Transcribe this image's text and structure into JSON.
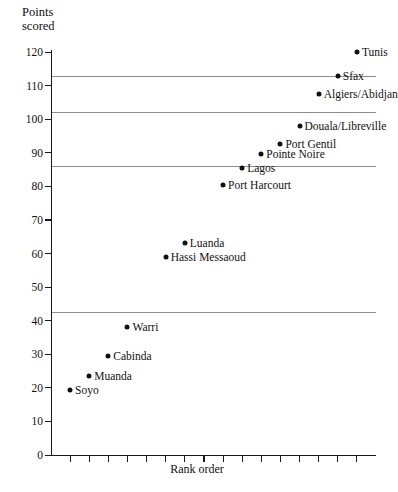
{
  "chart_data": {
    "type": "scatter",
    "title": "",
    "ylabel": "Points\nscored",
    "xlabel": "Rank order",
    "ylim": [
      0,
      120
    ],
    "ytick_values": [
      0,
      10,
      20,
      30,
      40,
      50,
      60,
      70,
      80,
      90,
      100,
      110,
      120
    ],
    "ytick_labels": [
      "0",
      "10",
      "20",
      "30",
      "40",
      "50",
      "60",
      "70",
      "80",
      "90",
      "100",
      "110",
      "120"
    ],
    "xlim": [
      0,
      17
    ],
    "xtick_count": 16,
    "xtick_labels": [],
    "grid": false,
    "legend": "none",
    "marker_color": "#111111",
    "reference_line_color": "#8c8c8c",
    "axis_color": "#1a1a1a",
    "reference_lines": [
      113,
      102,
      86,
      42.5
    ],
    "points": [
      {
        "label": "Tunis",
        "rank": 16,
        "value": 120.0,
        "label_side": "right"
      },
      {
        "label": "Sfax",
        "rank": 15,
        "value": 113.0,
        "label_side": "right"
      },
      {
        "label": "Algiers/Abidjan",
        "rank": 14,
        "value": 107.5,
        "label_side": "right"
      },
      {
        "label": "Douala/Libreville",
        "rank": 13,
        "value": 98.0,
        "label_side": "right"
      },
      {
        "label": "Port Gentil",
        "rank": 12,
        "value": 92.5,
        "label_side": "right"
      },
      {
        "label": "Pointe Noire",
        "rank": 11,
        "value": 89.5,
        "label_side": "right"
      },
      {
        "label": "Lagos",
        "rank": 10,
        "value": 85.5,
        "label_side": "right"
      },
      {
        "label": "Port Harcourt",
        "rank": 9,
        "value": 80.5,
        "label_side": "right"
      },
      {
        "label": "Luanda",
        "rank": 7,
        "value": 63.0,
        "label_side": "right"
      },
      {
        "label": "Hassi Messaoud",
        "rank": 6,
        "value": 59.0,
        "label_side": "right"
      },
      {
        "label": "Warri",
        "rank": 4,
        "value": 38.0,
        "label_side": "right"
      },
      {
        "label": "Cabinda",
        "rank": 3,
        "value": 29.5,
        "label_side": "right"
      },
      {
        "label": "Muanda",
        "rank": 2,
        "value": 23.5,
        "label_side": "right"
      },
      {
        "label": "Soyo",
        "rank": 1,
        "value": 19.5,
        "label_side": "right"
      }
    ]
  }
}
